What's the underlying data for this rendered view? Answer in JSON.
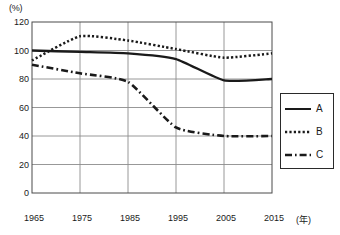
{
  "chart_data": {
    "type": "line",
    "title": "",
    "xlabel": "(年)",
    "ylabel": "(%)",
    "x": [
      1965,
      1975,
      1985,
      1995,
      2005,
      2015
    ],
    "xlim": [
      1965,
      2015
    ],
    "ylim": [
      0,
      120
    ],
    "ytick_values": [
      0,
      20,
      40,
      60,
      80,
      100,
      120
    ],
    "ytick_labels": [
      "0",
      "20",
      "40",
      "60",
      "80",
      "100",
      "120"
    ],
    "xtick_labels": [
      "1965",
      "1975",
      "1985",
      "1995",
      "2005",
      "2015"
    ],
    "grid": true,
    "legend_position": "right",
    "series": [
      {
        "name": "A",
        "style": "solid",
        "color": "#1a1a1a",
        "values": [
          100,
          99,
          98,
          94,
          79,
          80
        ]
      },
      {
        "name": "B",
        "style": "dotted",
        "color": "#1a1a1a",
        "values": [
          93,
          110,
          107,
          101,
          95,
          98
        ]
      },
      {
        "name": "C",
        "style": "dash-dot",
        "color": "#1a1a1a",
        "values": [
          90,
          84,
          78,
          46,
          40,
          40
        ]
      }
    ]
  },
  "axes": {
    "y_unit": "(%)",
    "x_unit": "(年)"
  },
  "legend": {
    "entries": [
      {
        "label": "A"
      },
      {
        "label": "B"
      },
      {
        "label": "C"
      }
    ]
  }
}
